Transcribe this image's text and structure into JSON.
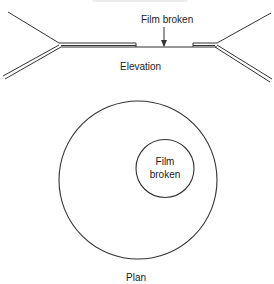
{
  "figure": {
    "type": "soap-film diagram",
    "colors": {
      "line": "#333333",
      "text": "#222222",
      "background": "#ffffff"
    }
  },
  "elevation": {
    "label": "Elevation",
    "annotation": "Film broken"
  },
  "plan": {
    "label": "Plan",
    "inner_circle_label": "Film broken"
  }
}
